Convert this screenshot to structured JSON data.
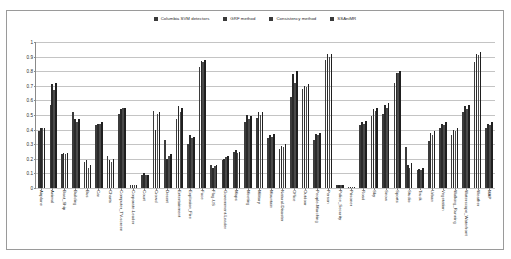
{
  "chart_data": {
    "type": "bar",
    "title": "",
    "xlabel": "",
    "ylabel": "",
    "ylim": [
      0,
      1
    ],
    "yticks": [
      "0",
      "0.1",
      "0.2",
      "0.3",
      "0.4",
      "0.5",
      "0.6",
      "0.7",
      "0.8",
      "0.9",
      "1"
    ],
    "grid": true,
    "legend_position": "top-center",
    "legend": [
      "Columbia SVM detectors",
      "GRF method",
      "Consistency method",
      "SSAniMR"
    ],
    "categories": [
      "Airplane",
      "Animal",
      "Boat_Ship",
      "Building",
      "Bus",
      "Car",
      "Charts",
      "Computer_TV-screen",
      "Corporate-Leader",
      "Court",
      "Crowd",
      "Desert",
      "Entertainment",
      "Explosion_Fire",
      "Face",
      "Flag-US",
      "Government-Leader",
      "Maps",
      "Meeting",
      "Military",
      "Mountain",
      "Natural-Disaster",
      "Office",
      "Outdoor",
      "People-Marching",
      "Person",
      "Police_Security",
      "Prisoner",
      "Road",
      "Sky",
      "Snow",
      "Sports",
      "Studio",
      "Truck",
      "Urban",
      "Vegetation",
      "Walking_Running",
      "Waterscape_Waterfront",
      "Weather",
      "MAP"
    ],
    "series": [
      {
        "name": "Columbia SVM detectors",
        "values": [
          0.39,
          0.57,
          0.23,
          0.52,
          0.18,
          0.43,
          0.22,
          0.51,
          0.02,
          0.09,
          0.53,
          0.33,
          0.47,
          0.3,
          0.83,
          0.16,
          0.19,
          0.25,
          0.45,
          0.48,
          0.34,
          0.27,
          0.62,
          0.68,
          0.33,
          0.88,
          0.02,
          0.01,
          0.43,
          0.49,
          0.51,
          0.72,
          0.28,
          0.12,
          0.32,
          0.41,
          0.36,
          0.52,
          0.86,
          0.41
        ]
      },
      {
        "name": "GRF method",
        "values": [
          0.41,
          0.71,
          0.24,
          0.47,
          0.19,
          0.44,
          0.19,
          0.54,
          0.02,
          0.1,
          0.4,
          0.2,
          0.56,
          0.36,
          0.87,
          0.14,
          0.2,
          0.26,
          0.5,
          0.52,
          0.36,
          0.29,
          0.78,
          0.7,
          0.37,
          0.92,
          0.02,
          0.01,
          0.45,
          0.54,
          0.57,
          0.79,
          0.16,
          0.13,
          0.38,
          0.44,
          0.4,
          0.56,
          0.92,
          0.44
        ]
      },
      {
        "name": "Consistency method",
        "values": [
          0.41,
          0.67,
          0.23,
          0.45,
          0.14,
          0.44,
          0.18,
          0.55,
          0.02,
          0.09,
          0.51,
          0.22,
          0.52,
          0.34,
          0.86,
          0.15,
          0.21,
          0.24,
          0.47,
          0.5,
          0.35,
          0.28,
          0.72,
          0.69,
          0.36,
          0.9,
          0.02,
          0.01,
          0.44,
          0.53,
          0.55,
          0.79,
          0.14,
          0.12,
          0.36,
          0.43,
          0.39,
          0.54,
          0.91,
          0.43
        ]
      },
      {
        "name": "SSAniMR",
        "values": [
          0.41,
          0.72,
          0.24,
          0.47,
          0.16,
          0.45,
          0.2,
          0.55,
          0.02,
          0.09,
          0.52,
          0.23,
          0.55,
          0.35,
          0.88,
          0.16,
          0.22,
          0.25,
          0.49,
          0.52,
          0.37,
          0.3,
          0.8,
          0.71,
          0.38,
          0.92,
          0.02,
          0.01,
          0.46,
          0.55,
          0.58,
          0.8,
          0.17,
          0.14,
          0.39,
          0.45,
          0.41,
          0.57,
          0.93,
          0.45
        ]
      }
    ]
  }
}
